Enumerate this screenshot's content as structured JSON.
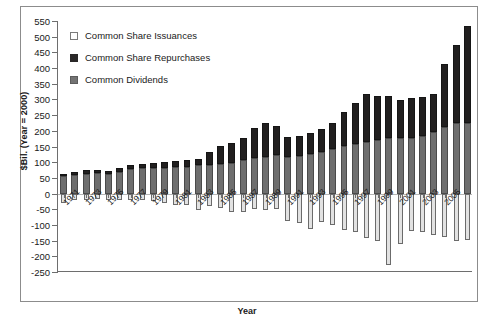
{
  "chart_data": {
    "type": "bar",
    "subtype": "stacked-bar-with-negative",
    "title": "",
    "xlabel": "Year",
    "ylabel": "$Bil. (Year = 2000)",
    "ylim": [
      -250,
      550
    ],
    "ytick_step": 50,
    "yticks": [
      550,
      500,
      450,
      400,
      350,
      300,
      250,
      200,
      150,
      100,
      50,
      0,
      -50,
      -100,
      -150,
      -200,
      -250
    ],
    "ytick_labels": [
      "550",
      "500",
      "450",
      "400",
      "350",
      "300",
      "250",
      "200",
      "150",
      "100",
      "50",
      "0",
      "-50",
      "-100",
      "-150",
      "-200",
      "-250"
    ],
    "grid": false,
    "legend_position": "upper-left",
    "x": [
      1971,
      1972,
      1973,
      1974,
      1975,
      1976,
      1977,
      1978,
      1979,
      1980,
      1981,
      1982,
      1983,
      1984,
      1985,
      1986,
      1987,
      1988,
      1989,
      1990,
      1991,
      1992,
      1993,
      1994,
      1995,
      1996,
      1997,
      1998,
      1999,
      2000,
      2001,
      2002,
      2003,
      2004,
      2005,
      2006,
      2007
    ],
    "xtick_labels": [
      "1971",
      "1973",
      "1975",
      "1977",
      "1979",
      "1981",
      "1983",
      "1985",
      "1987",
      "1989",
      "1991",
      "1993",
      "1995",
      "1997",
      "1999",
      "2001",
      "2003",
      "2005"
    ],
    "xtick_years": [
      1971,
      1973,
      1975,
      1977,
      1979,
      1981,
      1983,
      1985,
      1987,
      1989,
      1991,
      1993,
      1995,
      1997,
      1999,
      2001,
      2003,
      2005
    ],
    "series": [
      {
        "name": "Common Dividends",
        "color": "#6e6e6e",
        "stack": "positive",
        "values": [
          55,
          58,
          62,
          65,
          62,
          68,
          78,
          80,
          82,
          82,
          84,
          84,
          90,
          92,
          95,
          98,
          108,
          112,
          118,
          122,
          118,
          120,
          126,
          132,
          142,
          152,
          158,
          165,
          172,
          176,
          176,
          178,
          182,
          196,
          212,
          226,
          226
        ]
      },
      {
        "name": "Common Share Repurchases",
        "color": "#211f1f",
        "stack": "positive",
        "values": [
          8,
          10,
          12,
          10,
          10,
          12,
          14,
          14,
          16,
          18,
          20,
          22,
          20,
          42,
          58,
          64,
          70,
          96,
          106,
          92,
          62,
          64,
          66,
          74,
          82,
          108,
          130,
          152,
          140,
          136,
          122,
          126,
          126,
          120,
          200,
          246,
          308
        ]
      },
      {
        "name": "Common Share Issuances",
        "color": "#e2e2e2",
        "stack": "negative",
        "values": [
          -30,
          -22,
          -20,
          -18,
          -20,
          -22,
          -22,
          -22,
          -24,
          -30,
          -36,
          -38,
          -52,
          -40,
          -46,
          -60,
          -58,
          -50,
          -52,
          -48,
          -86,
          -94,
          -112,
          -92,
          -100,
          -116,
          -122,
          -142,
          -150,
          -228,
          -160,
          -118,
          -124,
          -132,
          -140,
          -152,
          -148
        ]
      }
    ]
  },
  "legend": {
    "items": [
      {
        "label": "Common Share Issuances",
        "swatch": "issuances"
      },
      {
        "label": "Common Share Repurchases",
        "swatch": "repurchases"
      },
      {
        "label": "Common Dividends",
        "swatch": "dividends"
      }
    ]
  },
  "axes": {
    "y_title": "$Bil. (Year = 2000)",
    "x_title": "Year"
  }
}
